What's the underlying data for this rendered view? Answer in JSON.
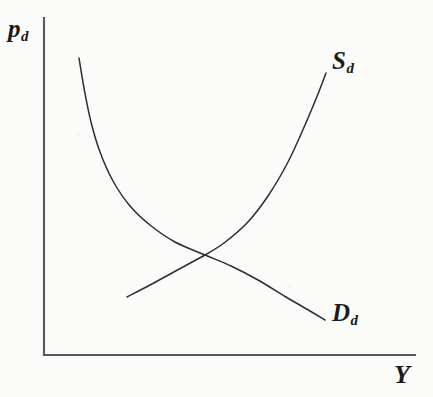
{
  "figure": {
    "kind": "supply-demand-diagram",
    "background_color": "#fbfbfa",
    "axis_color": "#59595c",
    "curve_color": "#2e2e31"
  },
  "axes": {
    "y_axis": {
      "label_base": "p",
      "label_sub": "d",
      "name": "domestic price"
    },
    "x_axis": {
      "label_base": "Y",
      "label_sub": "",
      "name": "output"
    }
  },
  "curves": {
    "supply": {
      "label_base": "S",
      "label_sub": "d",
      "name": "domestic supply"
    },
    "demand": {
      "label_base": "D",
      "label_sub": "d",
      "name": "domestic demand"
    }
  },
  "chart_data": {
    "type": "line",
    "title": "",
    "xlabel": "Y",
    "ylabel": "p_d",
    "grid": false,
    "legend": "inline-curve-labels",
    "axis_origin_px": [
      44,
      355
    ],
    "axis_extent_px": {
      "y_top": 18,
      "x_right": 415
    },
    "xlim_px": [
      44,
      415
    ],
    "ylim_px": [
      355,
      18
    ],
    "equilibrium_px": [
      205,
      255
    ],
    "series": [
      {
        "name": "S_d",
        "label": "S_d",
        "description": "domestic supply, upward sloping and convex",
        "points_px": [
          [
            127,
            297
          ],
          [
            150,
            285
          ],
          [
            172,
            273
          ],
          [
            194,
            261
          ],
          [
            205,
            255
          ],
          [
            224,
            243
          ],
          [
            247,
            223
          ],
          [
            268,
            196
          ],
          [
            288,
            162
          ],
          [
            305,
            125
          ],
          [
            318,
            94
          ],
          [
            326,
            73
          ]
        ]
      },
      {
        "name": "D_d",
        "label": "D_d",
        "description": "domestic demand, downward sloping and convex to origin",
        "points_px": [
          [
            79,
            58
          ],
          [
            84,
            88
          ],
          [
            91,
            122
          ],
          [
            100,
            152
          ],
          [
            113,
            181
          ],
          [
            130,
            206
          ],
          [
            150,
            225
          ],
          [
            175,
            242
          ],
          [
            205,
            255
          ],
          [
            231,
            266
          ],
          [
            258,
            280
          ],
          [
            286,
            297
          ],
          [
            310,
            311
          ],
          [
            325,
            320
          ]
        ]
      }
    ]
  }
}
